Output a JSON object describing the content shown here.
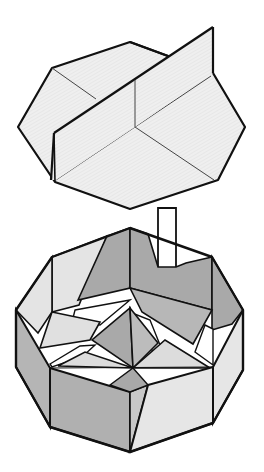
{
  "diagram": {
    "title": "Origami octagonal box assembly",
    "colors": {
      "background": "#ffffff",
      "paper_light": "#ececec",
      "paper_mid": "#d6d6d6",
      "paper_dark": "#a9a9a9",
      "paper_darker": "#bcbcbc",
      "hole": "#ffffff",
      "outline": "#111111",
      "crease": "#444444"
    },
    "steps": [
      {
        "id": "lid",
        "label": "Folded octagonal lid with raised flap"
      },
      {
        "id": "arrow",
        "label": "Insert downward"
      },
      {
        "id": "base",
        "label": "Octagonal box base with pinwheel interior"
      }
    ]
  }
}
